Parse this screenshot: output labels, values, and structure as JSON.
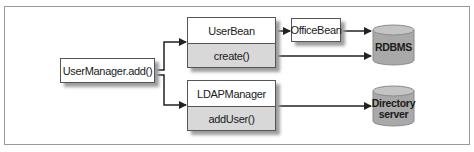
{
  "diagram": {
    "nodes": {
      "user_manager": {
        "label": "UserManager.add()"
      },
      "user_bean": {
        "title": "UserBean",
        "method": "create()"
      },
      "ldap_manager": {
        "title": "LDAPManager",
        "method": "addUser()"
      },
      "office_bean": {
        "label": "OfficeBean"
      },
      "rdbms": {
        "label": "RDBMS",
        "shape": "cylinder"
      },
      "directory_server": {
        "label_line1": "Directory",
        "label_line2": "server",
        "shape": "cylinder"
      }
    },
    "edges": [
      {
        "from": "UserManager.add()",
        "to": "UserBean"
      },
      {
        "from": "UserManager.add()",
        "to": "LDAPManager"
      },
      {
        "from": "UserBean",
        "to": "OfficeBean"
      },
      {
        "from": "OfficeBean",
        "to": "RDBMS"
      },
      {
        "from": "create()",
        "to": "RDBMS"
      },
      {
        "from": "addUser()",
        "to": "Directory server"
      }
    ],
    "colors": {
      "box_border": "#555555",
      "method_fill": "#d8d8d8",
      "cylinder_fill": "#a9a9a9",
      "shadow": "#9e9e9e",
      "arrow": "#222222"
    }
  }
}
